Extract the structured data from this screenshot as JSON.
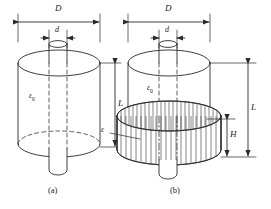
{
  "figure": {
    "background_color": "#ffffff",
    "line_color": "#2a2a2a",
    "hatch_color": "#3a3a3a",
    "panels": [
      {
        "id": "a",
        "caption": "(a)",
        "dimensions": [
          {
            "name": "D",
            "label": "D",
            "orientation": "horizontal",
            "position": "top"
          },
          {
            "name": "d",
            "label": "d",
            "orientation": "horizontal",
            "position": "top-inner"
          },
          {
            "name": "L",
            "label": "L",
            "orientation": "vertical",
            "position": "right"
          }
        ],
        "materials": [
          {
            "name": "air-gap",
            "label": "ε",
            "subscript": "0",
            "region": "full-cylinder"
          }
        ]
      },
      {
        "id": "b",
        "caption": "(b)",
        "dimensions": [
          {
            "name": "D",
            "label": "D",
            "orientation": "horizontal",
            "position": "top"
          },
          {
            "name": "d",
            "label": "d",
            "orientation": "horizontal",
            "position": "top-inner"
          },
          {
            "name": "L",
            "label": "L",
            "orientation": "vertical",
            "position": "right-outer"
          },
          {
            "name": "H",
            "label": "H",
            "orientation": "vertical",
            "position": "right-inner"
          }
        ],
        "materials": [
          {
            "name": "air-gap",
            "label": "ε",
            "subscript": "0",
            "region": "upper-cylinder"
          },
          {
            "name": "dielectric-insert",
            "label": "ε",
            "subscript": "",
            "region": "lower-hatched-disc"
          }
        ]
      }
    ]
  }
}
